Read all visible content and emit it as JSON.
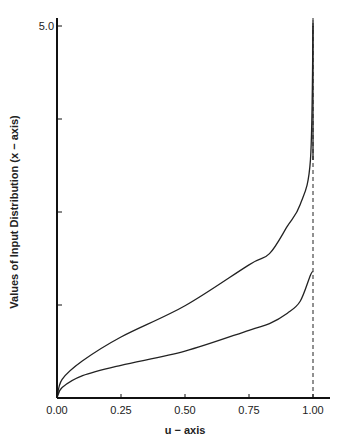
{
  "chart_data": {
    "type": "line",
    "title": "",
    "xlabel": "u − axis",
    "ylabel": "Values of Input Distribution (x − axis)",
    "xlim": [
      0,
      1.0
    ],
    "ylim": [
      0,
      5.0
    ],
    "x_ticks": [
      0.0,
      0.25,
      0.5,
      0.75,
      1.0
    ],
    "x_tick_labels": [
      "0.00",
      "0.25",
      "0.50",
      "0.75",
      "1.00"
    ],
    "y_ticks": [
      1.25,
      2.5,
      3.75,
      5.0
    ],
    "y_tick_labels": [
      "",
      "",
      "",
      "5.0"
    ],
    "grid": false,
    "legend": null,
    "annotations": [
      {
        "type": "vertical-asymptote",
        "x": 1.0,
        "style": "dashed",
        "note": "dashed line at u = 1.00"
      }
    ],
    "series": [
      {
        "name": "upper-curve",
        "x": [
          0.0,
          0.02,
          0.1,
          0.25,
          0.5,
          0.75,
          0.83,
          0.9,
          0.95,
          0.99,
          1.0
        ],
        "values": [
          0.0,
          0.25,
          0.5,
          0.82,
          1.24,
          1.79,
          1.94,
          2.31,
          2.6,
          3.2,
          5.0
        ]
      },
      {
        "name": "lower-curve",
        "x": [
          0.0,
          0.02,
          0.1,
          0.25,
          0.5,
          0.75,
          0.83,
          0.9,
          0.95,
          0.99,
          1.0
        ],
        "values": [
          0.0,
          0.14,
          0.3,
          0.44,
          0.63,
          0.91,
          1.0,
          1.14,
          1.3,
          1.65,
          1.7
        ]
      }
    ]
  },
  "colors": {
    "line": "#222222",
    "axis": "#111111",
    "background": "#ffffff"
  }
}
